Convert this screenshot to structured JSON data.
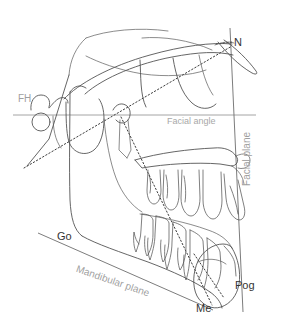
{
  "figure": {
    "type": "cephalometric-tracing",
    "background_color": "#ffffff",
    "anatomy_stroke_color": "#4a4a4a",
    "reference_line_color": "#9a9a9a",
    "dotted_line_color": "#3c3c3c",
    "label_dark_color": "#333333",
    "label_gray_color": "#a8a8a8"
  },
  "landmarks": [
    {
      "id": "n",
      "label": "N",
      "name": "nasion"
    },
    {
      "id": "go",
      "label": "Go",
      "name": "gonion"
    },
    {
      "id": "me",
      "label": "Me",
      "name": "menton"
    },
    {
      "id": "pog",
      "label": "Pog",
      "name": "pogonion"
    }
  ],
  "reference_lines": [
    {
      "id": "fh",
      "label": "FH",
      "name": "frankfort-horizontal"
    },
    {
      "id": "facial_plane",
      "label": "Facial plane",
      "name": "facial-plane"
    },
    {
      "id": "mandibular_plane",
      "label": "Mandibular plane",
      "name": "mandibular-plane"
    }
  ],
  "measurements": [
    {
      "id": "facial_angle",
      "label": "Facial angle",
      "name": "facial-angle"
    }
  ],
  "labels": {
    "fh": "FH",
    "n": "N",
    "go": "Go",
    "me": "Me",
    "pog": "Pog",
    "facial_angle": "Facial angle",
    "facial_plane": "Facial plane",
    "mandibular_plane": "Mandibular plane"
  }
}
